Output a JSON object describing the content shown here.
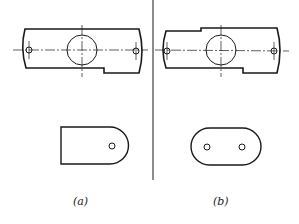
{
  "figure": {
    "stroke_color": "#1a1a1a",
    "panels": [
      {
        "id": "a",
        "label": "(a)"
      },
      {
        "id": "b",
        "label": "(b)"
      }
    ]
  }
}
